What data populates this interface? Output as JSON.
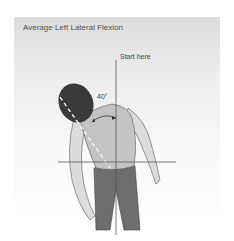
{
  "figure": {
    "title": "Average Left Lateral Flexion",
    "start_label": "Start here",
    "angle_label": "40°",
    "colors": {
      "background_top": "#dcdcdc",
      "skin": "#d9d9d9",
      "shirt": "#c4c4c4",
      "hair": "#3a3a3a",
      "pants": "#6e6e6e",
      "lines": "#555555"
    }
  }
}
